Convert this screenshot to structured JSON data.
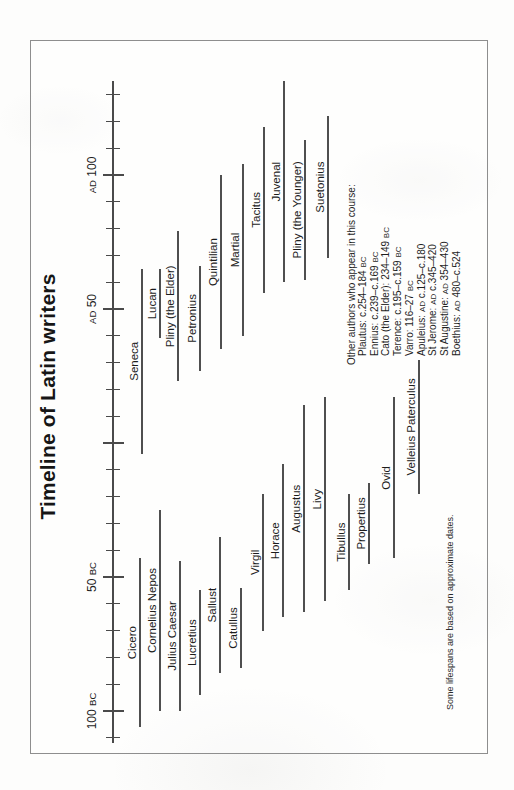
{
  "chart_data": {
    "type": "timeline",
    "title": "Timeline of Latin writers",
    "footnote": "Some lifespans are based on approximate dates.",
    "axis": {
      "unit": "years",
      "range": [
        -110,
        130
      ],
      "tick_interval": 10,
      "major_tick_interval": 50,
      "labels": [
        {
          "year": -100,
          "text": "100 BC"
        },
        {
          "year": -50,
          "text": "50 BC"
        },
        {
          "year": 50,
          "text": "AD 50"
        },
        {
          "year": 100,
          "text": "AD 100"
        }
      ]
    },
    "writers": [
      {
        "name": "Cicero",
        "start": -106,
        "end": -43,
        "row_y": 109
      },
      {
        "name": "Cornelius Nepos",
        "start": -100,
        "end": -25,
        "row_y": 129
      },
      {
        "name": "Julius Caesar",
        "start": -100,
        "end": -44,
        "row_y": 149
      },
      {
        "name": "Lucretius",
        "start": -94,
        "end": -55,
        "row_y": 169
      },
      {
        "name": "Sallust",
        "start": -86,
        "end": -35,
        "row_y": 189
      },
      {
        "name": "Catullus",
        "start": -84,
        "end": -54,
        "row_y": 210
      },
      {
        "name": "Virgil",
        "start": -70,
        "end": -19,
        "row_y": 232
      },
      {
        "name": "Horace",
        "start": -65,
        "end": -8,
        "row_y": 252
      },
      {
        "name": "Augustus",
        "start": -63,
        "end": 14,
        "row_y": 273
      },
      {
        "name": "Livy",
        "start": -59,
        "end": 17,
        "row_y": 294
      },
      {
        "name": "Tibullus",
        "start": -55,
        "end": -19,
        "row_y": 318
      },
      {
        "name": "Propertius",
        "start": -45,
        "end": -15,
        "row_y": 338
      },
      {
        "name": "Ovid",
        "start": -43,
        "end": 17,
        "row_y": 363
      },
      {
        "name": "Velleius Paterculus",
        "start": -19,
        "end": 31,
        "row_y": 388
      },
      {
        "name": "Seneca",
        "start": -4,
        "end": 65,
        "row_y": 111
      },
      {
        "name": "Lucan",
        "start": 39,
        "end": 65,
        "row_y": 129
      },
      {
        "name": "Pliny (the Elder)",
        "start": 23,
        "end": 79,
        "row_y": 147
      },
      {
        "name": "Petronius",
        "start": 27,
        "end": 66,
        "row_y": 169
      },
      {
        "name": "Quintilian",
        "start": 35,
        "end": 100,
        "row_y": 190
      },
      {
        "name": "Martial",
        "start": 40,
        "end": 104,
        "row_y": 212
      },
      {
        "name": "Tacitus",
        "start": 56,
        "end": 118,
        "row_y": 233
      },
      {
        "name": "Juvenal",
        "start": 60,
        "end": 135,
        "row_y": 253
      },
      {
        "name": "Pliny (the Younger)",
        "start": 61,
        "end": 113,
        "row_y": 274
      },
      {
        "name": "Suetonius",
        "start": 69,
        "end": 122,
        "row_y": 297
      }
    ],
    "other_authors": {
      "header": "Other authors who appear in this course:",
      "entries": [
        "Plautus: c.254–184 BC",
        "Ennius: c.239–c.169 BC",
        "Cato (the Elder): 234–149 BC",
        "Terence: c.195–c.159 BC",
        "Varro: 116–27 BC",
        "Apuleius: AD c.125–c.180",
        "St Jerome: AD c.345–420",
        "St Augustine: AD 354–430",
        "Boethius: AD 480–c.524"
      ]
    },
    "layout": {
      "rotation_deg": -90,
      "axis_line": {
        "x1": 9,
        "x2": 671,
        "y": 82
      },
      "year_zero_x": 309,
      "px_per_year": 2.68,
      "minor_tick_len": 14,
      "major_tick_len": 21,
      "tick_label_top": 54
    }
  }
}
